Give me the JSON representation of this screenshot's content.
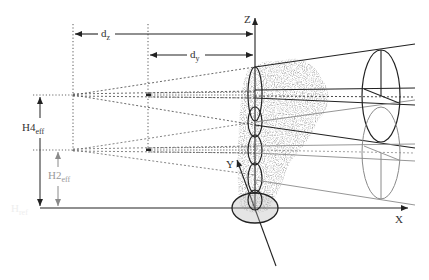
{
  "diagram": {
    "type": "geometry-schematic",
    "axes": {
      "x_label": "X",
      "y_label": "Y",
      "z_label": "Z"
    },
    "dimensions": {
      "dz": {
        "main": "d",
        "sub": "z"
      },
      "dy": {
        "main": "d",
        "sub": "y"
      },
      "h4": {
        "main": "H4",
        "sub": "eff"
      },
      "h2": {
        "main": "H2",
        "sub": "eff"
      },
      "href": {
        "main": "H",
        "sub": "ref"
      }
    },
    "colors": {
      "line": "#222222",
      "secondary": "#8a8a8a",
      "dotted": "#444444",
      "foliage": "#9a9a9a",
      "background": "#ffffff"
    }
  }
}
